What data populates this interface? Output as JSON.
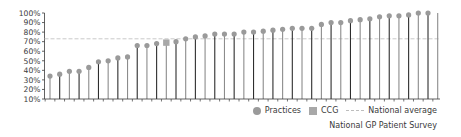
{
  "chart_data": {
    "type": "lollipop",
    "title": "",
    "xlabel": "",
    "ylabel": "",
    "ylim": [
      10,
      100
    ],
    "yticks": [
      "100%",
      "90%",
      "80%",
      "70%",
      "60%",
      "50%",
      "40%",
      "30%",
      "20%",
      "10%"
    ],
    "grid": false,
    "legend_position": "bottom-right",
    "series": [
      {
        "name": "Practices",
        "marker": "circle",
        "values": [
          34,
          36,
          39,
          39,
          43,
          49,
          50,
          53,
          54,
          66,
          66,
          68,
          null,
          70,
          73,
          75,
          76,
          78,
          78,
          78,
          80,
          80,
          81,
          82,
          83,
          84,
          84,
          84,
          88,
          90,
          90,
          92,
          93,
          94,
          96,
          97,
          97,
          98,
          100,
          100,
          100
        ]
      },
      {
        "name": "CCG",
        "marker": "square",
        "index": 12,
        "value": 69
      },
      {
        "name": "National average",
        "style": "dashed-line",
        "value": 73
      }
    ]
  },
  "legend": {
    "practices_label": "Practices",
    "ccg_label": "CCG",
    "national_label": "National average"
  },
  "source": "National GP Patient Survey",
  "colors": {
    "marker": "#9a9a9a",
    "ccg_marker": "#a8a8a8",
    "stem_dark": "#2e2e2e",
    "stem_gray": "#8c8c8c",
    "national_line": "#c4c4c4",
    "axis": "#3a3a3a",
    "text": "#3a3a3a"
  }
}
